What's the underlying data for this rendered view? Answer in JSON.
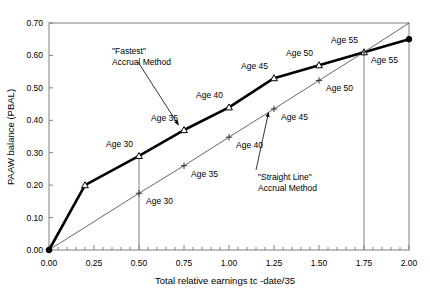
{
  "chart_data": {
    "type": "line",
    "title": "",
    "xlabel": "Total relative earnings tc -date/35",
    "ylabel": "PAAW balance (PBAL)",
    "xlim": [
      0.0,
      2.0
    ],
    "ylim": [
      0.0,
      0.7
    ],
    "xticks": [
      "0.00",
      "0.25",
      "0.50",
      "0.75",
      "1.00",
      "1.25",
      "1.50",
      "1.75",
      "2.00"
    ],
    "xtick_values": [
      0.0,
      0.25,
      0.5,
      0.75,
      1.0,
      1.25,
      1.5,
      1.75,
      2.0
    ],
    "yticks": [
      "0.00",
      "0.10",
      "0.20",
      "0.30",
      "0.40",
      "0.50",
      "0.60",
      "0.70"
    ],
    "ytick_values": [
      0.0,
      0.1,
      0.2,
      0.3,
      0.4,
      0.5,
      0.6,
      0.7
    ],
    "minor_xtick_interval": 0.05,
    "grid": false,
    "legend_position": "none",
    "series": [
      {
        "name": "\"Fastest\" Accrual Method",
        "marker": "triangle",
        "line_width": "bold",
        "color": "#000000",
        "x": [
          0.0,
          0.2,
          0.5,
          0.75,
          1.0,
          1.25,
          1.5,
          1.75,
          2.0
        ],
        "y": [
          0.0,
          0.2,
          0.29,
          0.37,
          0.44,
          0.53,
          0.57,
          0.61,
          0.65
        ],
        "point_labels": [
          "",
          "",
          "Age 30",
          "Age 35",
          "Age 40",
          "Age 45",
          "Age 50",
          "Age 55",
          ""
        ]
      },
      {
        "name": "\"Straight Line\" Accrual Method",
        "marker": "plus",
        "line_width": "thin",
        "color": "#555555",
        "x": [
          0.0,
          0.5,
          0.75,
          1.0,
          1.25,
          1.5,
          1.75,
          2.0
        ],
        "y": [
          0.0,
          0.175,
          0.26,
          0.348,
          0.435,
          0.523,
          0.61,
          0.7
        ],
        "point_labels": [
          "",
          "Age 30",
          "Age 35",
          "Age 40",
          "Age 45",
          "Age 50",
          "Age 55",
          ""
        ]
      }
    ],
    "annotations": [
      {
        "text_line1": "\"Fastest\"",
        "text_line2": "Accrual Method",
        "points_to_x": 0.72,
        "points_to_y": 0.385
      },
      {
        "text_line1": "\"Straight Line\"",
        "text_line2": "Accrual Method",
        "points_to_x": 1.22,
        "points_to_y": 0.425
      }
    ],
    "drop_lines": [
      {
        "x": 0.5,
        "y_top": 0.29
      },
      {
        "x": 1.75,
        "y_top": 0.61
      }
    ]
  }
}
